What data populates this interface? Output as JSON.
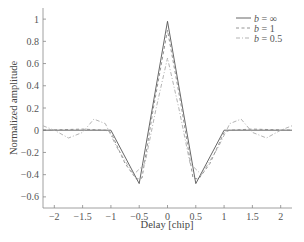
{
  "chart_data": {
    "type": "line",
    "title": "",
    "xlabel": "Delay [chip]",
    "ylabel": "Normalized amplitude",
    "xlim": [
      -2.2,
      2.2
    ],
    "ylim": [
      -0.7,
      1.1
    ],
    "xticks": [
      -2,
      -1.5,
      -1,
      -0.5,
      0,
      0.5,
      1,
      1.5,
      2
    ],
    "xtick_labels": [
      "−2",
      "−1.5",
      "−1",
      "−0.5",
      "0",
      "0.5",
      "1",
      "1.5",
      "2"
    ],
    "yticks": [
      1,
      0.8,
      0.6,
      0.4,
      0.2,
      0,
      -0.2,
      -0.4,
      -0.6
    ],
    "ytick_labels": [
      "1",
      "0.8",
      "0.6",
      "0.4",
      "0.2",
      "0",
      "−0.2",
      "−0.4",
      "−0.6"
    ],
    "grid": false,
    "legend_position": "upper right",
    "series": [
      {
        "name": "b = ∞",
        "b_value": "∞",
        "style": "solid",
        "color": "#555555",
        "x": [
          -2.2,
          -1,
          -0.5,
          0,
          0.5,
          1,
          2.2
        ],
        "y": [
          0,
          0,
          -0.48,
          0.98,
          -0.48,
          0,
          0
        ]
      },
      {
        "name": "b = 1",
        "b_value": "1",
        "style": "dashed",
        "color": "#888888",
        "x": [
          -2.2,
          -1.5,
          -1.1,
          -1,
          -0.75,
          -0.55,
          -0.45,
          -0.25,
          0,
          0.25,
          0.45,
          0.55,
          0.75,
          1,
          1.1,
          1.5,
          2.2
        ],
        "y": [
          0,
          0.01,
          0,
          -0.02,
          -0.3,
          -0.44,
          -0.43,
          0.2,
          0.9,
          0.2,
          -0.43,
          -0.44,
          -0.3,
          -0.02,
          0,
          0.01,
          0
        ]
      },
      {
        "name": "b = 0.5",
        "b_value": "0.5",
        "style": "dash-dot",
        "color": "#aaaaaa",
        "x": [
          -2.2,
          -2,
          -1.75,
          -1.5,
          -1.3,
          -1.1,
          -0.9,
          -0.6,
          -0.4,
          -0.2,
          0,
          0.2,
          0.4,
          0.6,
          0.9,
          1.1,
          1.3,
          1.5,
          1.75,
          2,
          2.2
        ],
        "y": [
          0.04,
          0,
          -0.07,
          -0.02,
          0.1,
          0.06,
          -0.15,
          -0.4,
          -0.3,
          0.2,
          0.65,
          0.2,
          -0.3,
          -0.4,
          -0.15,
          0.06,
          0.1,
          -0.02,
          -0.07,
          0,
          0.04
        ]
      }
    ]
  },
  "legend": {
    "items": [
      {
        "var": "b",
        "eq": " = ∞"
      },
      {
        "var": "b",
        "eq": " = 1"
      },
      {
        "var": "b",
        "eq": " = 0.5"
      }
    ]
  }
}
